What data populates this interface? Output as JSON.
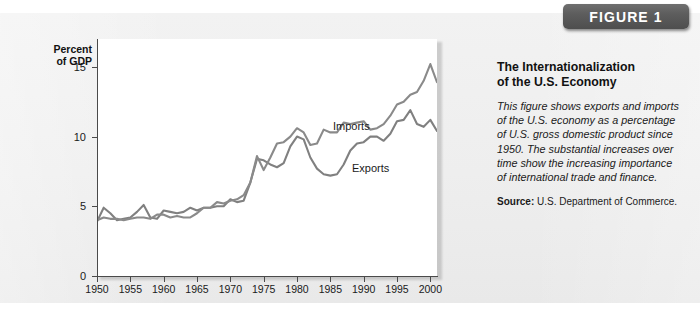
{
  "figure": {
    "badge_label": "FIGURE 1",
    "title_line1": "The Internationalization",
    "title_line2": "of the U.S. Economy",
    "caption": "This figure shows exports and imports of the U.S. economy as a percentage of U.S. gross domestic product since 1950. The substantial increases over time show the increasing importance of international trade and finance.",
    "source_label": "Source:",
    "source_text": "U.S. Department of Commerce."
  },
  "colors": {
    "line": "#808080",
    "axis": "#4a4a4a",
    "panel_bg": "#efefef",
    "plot_bg": "#ffffff",
    "badge_bg": "#5d5d5d",
    "badge_text": "#ffffff"
  },
  "chart_data": {
    "type": "line",
    "title": "The Internationalization of the U.S. Economy",
    "xlabel": "",
    "ylabel": "Percent of GDP",
    "ylabel_line1": "Percent",
    "ylabel_line2": "of GDP",
    "xlim": [
      1950,
      2001
    ],
    "ylim": [
      0,
      17
    ],
    "yticks": [
      0,
      5,
      10,
      15
    ],
    "ytick_labels": [
      "0",
      "5",
      "10",
      "15"
    ],
    "xticks": [
      1950,
      1955,
      1960,
      1965,
      1970,
      1975,
      1980,
      1985,
      1990,
      1995,
      2000
    ],
    "xtick_labels": [
      "1950",
      "1955",
      "1960",
      "1965",
      "1970",
      "1975",
      "1980",
      "1985",
      "1990",
      "1995",
      "2000"
    ],
    "grid": false,
    "legend": "inline-annotations",
    "annotations": [
      {
        "text": "Imports",
        "x": 1987,
        "y": 11.9
      },
      {
        "text": "Exports",
        "x": 1990,
        "y": 8.6
      }
    ],
    "x": [
      1950,
      1951,
      1952,
      1953,
      1954,
      1955,
      1956,
      1957,
      1958,
      1959,
      1960,
      1961,
      1962,
      1963,
      1964,
      1965,
      1966,
      1967,
      1968,
      1969,
      1970,
      1971,
      1972,
      1973,
      1974,
      1975,
      1976,
      1977,
      1978,
      1979,
      1980,
      1981,
      1982,
      1983,
      1984,
      1985,
      1986,
      1987,
      1988,
      1989,
      1990,
      1991,
      1992,
      1993,
      1994,
      1995,
      1996,
      1997,
      1998,
      1999,
      2000,
      2001
    ],
    "series": [
      {
        "name": "Exports",
        "values": [
          3.9,
          4.9,
          4.5,
          4.0,
          4.1,
          4.2,
          4.6,
          5.1,
          4.2,
          4.1,
          4.7,
          4.6,
          4.5,
          4.6,
          4.9,
          4.7,
          4.9,
          4.9,
          5.0,
          5.0,
          5.5,
          5.3,
          5.4,
          6.7,
          8.4,
          8.3,
          8.0,
          7.8,
          8.1,
          9.3,
          10.0,
          9.8,
          8.5,
          7.7,
          7.3,
          7.2,
          7.3,
          8.0,
          9.0,
          9.5,
          9.6,
          10.0,
          10.0,
          9.7,
          10.2,
          11.1,
          11.2,
          11.9,
          10.9,
          10.7,
          11.2,
          10.4
        ]
      },
      {
        "name": "Imports",
        "values": [
          4.0,
          4.2,
          4.1,
          4.1,
          4.0,
          4.1,
          4.2,
          4.2,
          4.1,
          4.4,
          4.4,
          4.2,
          4.3,
          4.2,
          4.2,
          4.5,
          4.9,
          4.9,
          5.3,
          5.2,
          5.4,
          5.5,
          5.8,
          6.7,
          8.6,
          7.6,
          8.5,
          9.5,
          9.6,
          10.0,
          10.6,
          10.3,
          9.4,
          9.5,
          10.5,
          10.3,
          10.3,
          11.0,
          10.9,
          11.0,
          11.1,
          10.5,
          10.6,
          10.9,
          11.5,
          12.3,
          12.5,
          13.0,
          13.2,
          14.0,
          15.2,
          13.9
        ]
      }
    ]
  }
}
